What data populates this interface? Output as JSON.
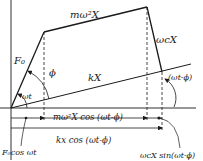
{
  "diagram": {
    "colors": {
      "ink": "#1a1a1a",
      "background": "#ffffff"
    },
    "labels": {
      "inertia_force": "mω²X",
      "damping_force": "ωcX",
      "exciting_force": "F₀",
      "spring_force": "kX",
      "phase_angle": "ϕ",
      "omega_t": "ωt",
      "omega_t_minus_phi": "(ωt-ϕ)",
      "inertia_projection": "mω²X cos (ωt-ϕ)",
      "spring_projection": "kx cos (ωt-ϕ)",
      "exciting_projection": "F₀cos ωt",
      "damping_projection": "ωcX sin(ωt-ϕ)"
    },
    "points": {
      "origin": [
        11,
        108
      ],
      "F0_tip": [
        44,
        32
      ],
      "inertia_tip": [
        147,
        7
      ],
      "damping_tip": [
        162,
        72
      ],
      "kX_line_end": [
        190,
        64
      ]
    }
  }
}
